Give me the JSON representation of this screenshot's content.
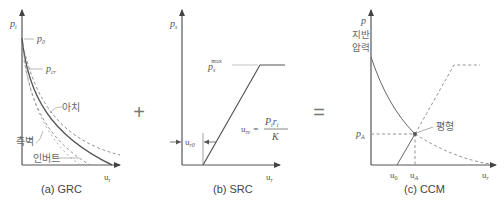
{
  "figure": {
    "operator_plus": "+",
    "operator_equals": "=",
    "panels": [
      {
        "id": "a",
        "caption": "(a) GRC",
        "y_label": "p",
        "y_label_sub": "i",
        "x_label": "u",
        "x_label_sub": "r",
        "annotations": {
          "p0": "p",
          "p0_sub": "0",
          "pcr": "p",
          "pcr_sub": "cr",
          "arch": "아치",
          "sidewall": "측벽",
          "invert": "인버트"
        }
      },
      {
        "id": "b",
        "caption": "(b) SRC",
        "y_label": "p",
        "y_label_sub": "s",
        "x_label": "u",
        "x_label_sub": "r",
        "annotations": {
          "ps_max": "p",
          "ps_max_sub": "s",
          "ps_max_sup": "max",
          "ur0": "u",
          "ur0_sub": "r0",
          "ure_lhs": "u",
          "ure_lhs_sub": "re",
          "ure_eq": "=",
          "ure_num": "P",
          "ure_num_sub": "i",
          "ure_num_r": "r",
          "ure_num_r_sub": "i",
          "ure_den": "K"
        }
      },
      {
        "id": "c",
        "caption": "(c) CCM",
        "y_label": "p",
        "y_label_line1": "지반",
        "y_label_line2": "압력",
        "x_label": "u",
        "x_label_sub": "r",
        "annotations": {
          "pA": "p",
          "pA_sub": "A",
          "u0": "u",
          "u0_sub": "0",
          "uA": "u",
          "uA_sub": "A",
          "equilibrium": "평형"
        }
      }
    ]
  },
  "colors": {
    "axis": "#555555",
    "curve": "#555555",
    "dashed": "#888888",
    "leader": "#999999"
  }
}
